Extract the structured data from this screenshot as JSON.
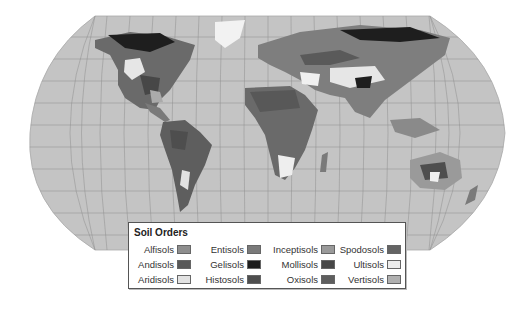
{
  "map": {
    "projection": "robinson-like",
    "ocean_color": "#c4c4c4",
    "graticule_color": "#8a8a8a"
  },
  "legend": {
    "title": "Soil Orders",
    "items": [
      {
        "label": "Alfisols",
        "color": "#8e8e8e"
      },
      {
        "label": "Andisols",
        "color": "#585858"
      },
      {
        "label": "Aridisols",
        "color": "#e2e2e2"
      },
      {
        "label": "Entisols",
        "color": "#7a7a7a"
      },
      {
        "label": "Gelisols",
        "color": "#1e1e1e"
      },
      {
        "label": "Histosols",
        "color": "#4e4e4e"
      },
      {
        "label": "Inceptisols",
        "color": "#9a9a9a"
      },
      {
        "label": "Mollisols",
        "color": "#474747"
      },
      {
        "label": "Oxisols",
        "color": "#5e5e5e"
      },
      {
        "label": "Spodosols",
        "color": "#646464"
      },
      {
        "label": "Ultisols",
        "color": "#ececec"
      },
      {
        "label": "Vertisols",
        "color": "#b0b0b0"
      }
    ]
  }
}
